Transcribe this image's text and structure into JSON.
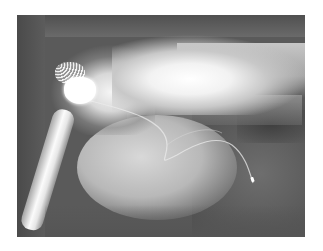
{
  "image": {
    "type": "radiograph",
    "view": "lateral thoracic",
    "subject": "animal thorax with implanted pacemaker",
    "features": [
      "pacemaker-generator",
      "pacing-lead",
      "electrode-tip",
      "spine",
      "humerus",
      "cardiac-silhouette"
    ],
    "colors": {
      "background": "#ffffff",
      "film_dark": "#5a5a5a",
      "bone_bright": "#ffffff"
    }
  }
}
